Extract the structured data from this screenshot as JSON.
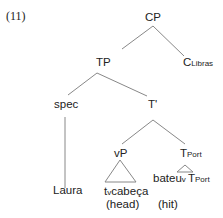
{
  "example_number": "(11)",
  "tree": {
    "cp": "CP",
    "tp": "TP",
    "c_head": "C",
    "c_sub": "Libras",
    "spec": "spec",
    "tbar": "T'",
    "laura": "Laura",
    "vp": "vP",
    "tport": "T",
    "tport_sub": "Port",
    "tv": "t",
    "tv_sub": "v",
    "cabeca": "cabeça",
    "head_gloss": "(head)",
    "bateu": "bateu",
    "bateu_sub": "v",
    "tport2": "T",
    "tport2_sub": "Port",
    "hit_gloss": "(hit)"
  }
}
